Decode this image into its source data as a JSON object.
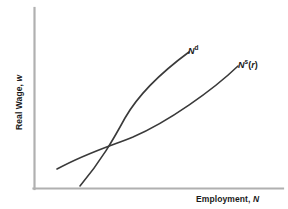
{
  "figure": {
    "background_color": "#ffffff",
    "axis_color": "#b0b0b0",
    "curve_color": "#3a3a3a",
    "text_color": "#1a1a1a"
  },
  "axes": {
    "y_title_text": "Real Wage, ",
    "y_title_var": "w",
    "x_title_text": "Employment, ",
    "x_title_var": "N"
  },
  "labels": {
    "demand_base": "N",
    "demand_sup": "d",
    "supply_base": "N",
    "supply_sup": "s",
    "supply_open_paren": "(",
    "supply_arg": "r",
    "supply_close_paren": ")"
  },
  "chart_data": {
    "type": "line",
    "title": "",
    "xlabel": "Employment, N",
    "ylabel": "Real Wage, w",
    "grid": false,
    "legend": "inline-curve-labels",
    "axis_ticks": "none",
    "xlim": [
      0,
      100
    ],
    "ylim": [
      0,
      100
    ],
    "series": [
      {
        "name": "N^d",
        "label": "Nd",
        "description": "Labor demand curve, upward sloping and steep, convex toward upper-left",
        "points": [
          {
            "x": 18.5,
            "y": 1.6
          },
          {
            "x": 27.0,
            "y": 13.0
          },
          {
            "x": 34.0,
            "y": 23.0
          },
          {
            "x": 39.8,
            "y": 34.5
          },
          {
            "x": 46.0,
            "y": 48.0
          },
          {
            "x": 52.0,
            "y": 62.0
          },
          {
            "x": 58.0,
            "y": 75.5
          },
          {
            "x": 62.2,
            "y": 85.0
          }
        ],
        "path_svg": "M 80,186 C 101,161 113,140 125,118 C 141,90 170,66 189,52"
      },
      {
        "name": "N^s(r)",
        "label": "Ns(r)",
        "description": "Labor supply curve, upward sloping and shallower, convex toward lower-right",
        "points": [
          {
            "x": 9.2,
            "y": 11.0
          },
          {
            "x": 20.0,
            "y": 22.5
          },
          {
            "x": 32.0,
            "y": 33.5
          },
          {
            "x": 45.0,
            "y": 44.5
          },
          {
            "x": 58.0,
            "y": 56.5
          },
          {
            "x": 70.0,
            "y": 68.0
          },
          {
            "x": 80.5,
            "y": 78.0
          }
        ],
        "path_svg": "M 57,169 C 86,153 113,145 133,137 C 168,122 213,90 238,66"
      }
    ],
    "annotations": [
      {
        "name": "equilibrium-intersection",
        "x": 39.8,
        "y": 34.5,
        "note": "Curves cross; no tick labels or coordinate markers shown"
      }
    ]
  }
}
